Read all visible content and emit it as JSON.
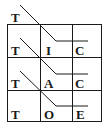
{
  "diagram": {
    "header_letter": "T",
    "grid": {
      "rows": [
        [
          "T",
          "I",
          "C"
        ],
        [
          "T",
          "A",
          "C"
        ],
        [
          "T",
          "O",
          "E"
        ]
      ]
    },
    "line_color": "#1a1a1a"
  }
}
